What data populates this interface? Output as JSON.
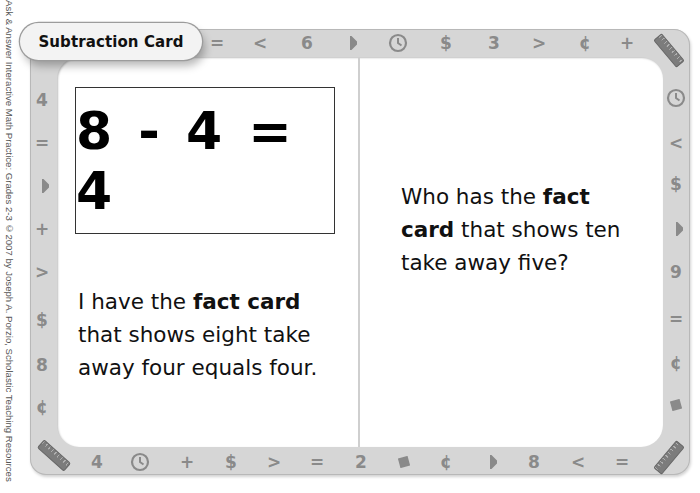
{
  "credit_line": "Ask & Answer Interactive Math Practice: Grades 2-3 ©2007 by Joseph A. Porzio, Scholastic Teaching Resources",
  "card": {
    "title": "Subtraction Card",
    "fact_equation": "8 - 4 = 4",
    "left_text": {
      "pre": "I have the ",
      "bold": "fact card",
      "line2": "that shows eight take",
      "line3": "away four equals four."
    },
    "right_text": {
      "pre": "Who has the ",
      "bold1": "fact",
      "bold2": "card",
      "mid": " that shows ten",
      "line3": "take away five?"
    }
  },
  "border_symbols": {
    "top": [
      "=",
      "<",
      "6",
      "triangle-icon",
      "clock-icon",
      "$",
      "3",
      ">",
      "¢",
      "+",
      "ruler-icon"
    ],
    "left": [
      "4",
      "=",
      "triangle-icon",
      "+",
      ">",
      "$",
      "8",
      "¢"
    ],
    "right": [
      "clock-icon",
      "<",
      "$",
      "triangle-icon",
      "9",
      "=",
      "¢",
      "square-icon"
    ],
    "bottom": [
      "ruler-icon",
      "4",
      "clock-icon",
      "+",
      "$",
      ">",
      "=",
      "2",
      "square-icon",
      "¢",
      "triangle-icon",
      "8",
      "<",
      "=",
      "ruler-icon"
    ]
  },
  "colors": {
    "frame": "#d6d6d6",
    "symbol": "#8a8a8a",
    "panel": "#ffffff",
    "text": "#111111"
  }
}
